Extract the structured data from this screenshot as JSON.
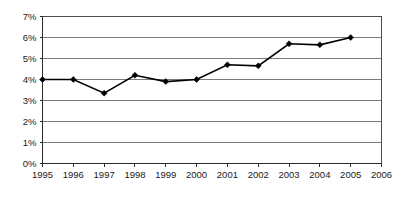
{
  "chart_data": {
    "type": "line",
    "title": "",
    "subtitle": "",
    "xlabel": "",
    "ylabel": "",
    "x": [
      1995,
      1996,
      1997,
      1998,
      1999,
      2000,
      2001,
      2002,
      2003,
      2004,
      2005
    ],
    "values": [
      4.0,
      4.0,
      3.35,
      4.2,
      3.9,
      4.0,
      4.7,
      4.65,
      5.7,
      5.65,
      6.0
    ],
    "series": [
      {
        "name": "",
        "values": [
          4.0,
          4.0,
          3.35,
          4.2,
          3.9,
          4.0,
          4.7,
          4.65,
          5.7,
          5.65,
          6.0
        ]
      }
    ],
    "x_tick_labels": [
      "1995",
      "1996",
      "1997",
      "1998",
      "1999",
      "2000",
      "2001",
      "2002",
      "2003",
      "2004",
      "2005",
      "2006"
    ],
    "x_tick_values": [
      1995,
      1996,
      1997,
      1998,
      1999,
      2000,
      2001,
      2002,
      2003,
      2004,
      2005,
      2006
    ],
    "y_tick_labels": [
      "0%",
      "1%",
      "2%",
      "3%",
      "4%",
      "5%",
      "6%",
      "7%"
    ],
    "y_tick_values": [
      0,
      1,
      2,
      3,
      4,
      5,
      6,
      7
    ],
    "xlim": [
      1995,
      2006
    ],
    "ylim": [
      0,
      7
    ],
    "grid": "horizontal",
    "legend": "none",
    "marker": "diamond",
    "line_color": "#000000",
    "grid_color": "#7b7b7b",
    "border_color": "#4d4d4d",
    "background_color": "#ffffff",
    "annotations": []
  }
}
